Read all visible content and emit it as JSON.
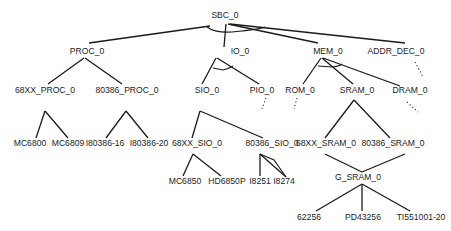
{
  "diagram": {
    "type": "and-or-tree",
    "root": "SBC_0",
    "nodes": [
      {
        "id": "SBC_0",
        "label": "SBC_0",
        "x": 225,
        "y": 18
      },
      {
        "id": "PROC_0",
        "label": "PROC_0",
        "x": 87,
        "y": 54
      },
      {
        "id": "IO_0",
        "label": "IO_0",
        "x": 240,
        "y": 54
      },
      {
        "id": "MEM_0",
        "label": "MEM_0",
        "x": 328,
        "y": 54
      },
      {
        "id": "ADDR_DEC_0",
        "label": "ADDR_DEC_0",
        "x": 396,
        "y": 54
      },
      {
        "id": "68XX_PROC_0",
        "label": "68XX_PROC_0",
        "x": 45,
        "y": 93
      },
      {
        "id": "80386_PROC_0",
        "label": "80386_PROC_0",
        "x": 127,
        "y": 93
      },
      {
        "id": "SIO_0",
        "label": "SIO_0",
        "x": 207,
        "y": 93
      },
      {
        "id": "PIO_0",
        "label": "PIO_0",
        "x": 262,
        "y": 93
      },
      {
        "id": "ROM_0",
        "label": "ROM_0",
        "x": 300,
        "y": 93
      },
      {
        "id": "SRAM_0",
        "label": "SRAM_0",
        "x": 357,
        "y": 93
      },
      {
        "id": "DRAM_0",
        "label": "DRAM_0",
        "x": 410,
        "y": 93
      },
      {
        "id": "MC6800",
        "label": "MC6800",
        "x": 30,
        "y": 146
      },
      {
        "id": "MC6809",
        "label": "MC6809",
        "x": 68,
        "y": 146
      },
      {
        "id": "I80386-16",
        "label": "I80386-16",
        "x": 105,
        "y": 146
      },
      {
        "id": "I80386-20",
        "label": "I80386-20",
        "x": 149,
        "y": 146
      },
      {
        "id": "68XX_SIO_0",
        "label": "68XX_SIO_0",
        "x": 197,
        "y": 146
      },
      {
        "id": "80386_SIO_0",
        "label": "80386_SIO_0",
        "x": 272,
        "y": 146
      },
      {
        "id": "68XX_SRAM_0",
        "label": "68XX_SRAM_0",
        "x": 326,
        "y": 146
      },
      {
        "id": "80386_SRAM_0",
        "label": "80386_SRAM_0",
        "x": 393,
        "y": 146
      },
      {
        "id": "MC6850",
        "label": "MC6850",
        "x": 185,
        "y": 184
      },
      {
        "id": "HD6850P",
        "label": "HD6850P",
        "x": 227,
        "y": 184
      },
      {
        "id": "I8251",
        "label": "I8251",
        "x": 260,
        "y": 184
      },
      {
        "id": "I8274",
        "label": "I8274",
        "x": 284,
        "y": 184
      },
      {
        "id": "G_SRAM_0",
        "label": "G_SRAM_0",
        "x": 358,
        "y": 180
      },
      {
        "id": "62256",
        "label": "62256",
        "x": 309,
        "y": 220
      },
      {
        "id": "PD43256",
        "label": "PD43256",
        "x": 363,
        "y": 220
      },
      {
        "id": "TI551001-20",
        "label": "TI551001-20",
        "x": 421,
        "y": 220
      }
    ],
    "edges": [
      {
        "from": "SBC_0",
        "to": "PROC_0",
        "style": "solid",
        "x1": 210,
        "y1": 26,
        "x2": 89,
        "y2": 43
      },
      {
        "from": "SBC_0",
        "to": "IO_0",
        "style": "solid",
        "x1": 226,
        "y1": 24,
        "x2": 224,
        "y2": 47
      },
      {
        "from": "SBC_0",
        "to": "MEM_0",
        "style": "solid",
        "x1": 228,
        "y1": 24,
        "x2": 318,
        "y2": 43
      },
      {
        "from": "SBC_0",
        "to": "ADDR_DEC_0",
        "style": "solid",
        "x1": 230,
        "y1": 24,
        "x2": 405,
        "y2": 43
      },
      {
        "from": "PROC_0",
        "to": "68XX_PROC_0",
        "style": "solid",
        "x1": 84,
        "y1": 58,
        "x2": 48,
        "y2": 84
      },
      {
        "from": "PROC_0",
        "to": "80386_PROC_0",
        "style": "solid",
        "x1": 85,
        "y1": 58,
        "x2": 122,
        "y2": 84
      },
      {
        "from": "IO_0",
        "to": "SIO_0",
        "style": "solid",
        "x1": 216,
        "y1": 58,
        "x2": 202,
        "y2": 84
      },
      {
        "from": "IO_0",
        "to": "PIO_0",
        "style": "solid",
        "x1": 217,
        "y1": 58,
        "x2": 259,
        "y2": 84
      },
      {
        "from": "MEM_0",
        "to": "ROM_0",
        "style": "solid",
        "x1": 321,
        "y1": 58,
        "x2": 303,
        "y2": 84
      },
      {
        "from": "MEM_0",
        "to": "SRAM_0",
        "style": "solid",
        "x1": 322,
        "y1": 58,
        "x2": 353,
        "y2": 84
      },
      {
        "from": "MEM_0",
        "to": "DRAM_0",
        "style": "solid",
        "x1": 323,
        "y1": 58,
        "x2": 400,
        "y2": 86
      },
      {
        "from": "68XX_PROC_0",
        "to": "MC6800",
        "style": "solid",
        "x1": 45,
        "y1": 111,
        "x2": 36,
        "y2": 138
      },
      {
        "from": "68XX_PROC_0",
        "to": "MC6809",
        "style": "solid",
        "x1": 45,
        "y1": 111,
        "x2": 68,
        "y2": 138
      },
      {
        "from": "80386_PROC_0",
        "to": "I80386-16",
        "style": "solid",
        "x1": 126,
        "y1": 111,
        "x2": 106,
        "y2": 138
      },
      {
        "from": "80386_PROC_0",
        "to": "I80386-20",
        "style": "solid",
        "x1": 126,
        "y1": 111,
        "x2": 148,
        "y2": 138
      },
      {
        "from": "SIO_0",
        "to": "68XX_SIO_0",
        "style": "solid",
        "x1": 200,
        "y1": 111,
        "x2": 192,
        "y2": 138
      },
      {
        "from": "SIO_0",
        "to": "80386_SIO_0",
        "style": "solid",
        "x1": 200,
        "y1": 111,
        "x2": 263,
        "y2": 138
      },
      {
        "from": "SRAM_0",
        "to": "68XX_SRAM_0",
        "style": "solid",
        "x1": 354,
        "y1": 100,
        "x2": 325,
        "y2": 138
      },
      {
        "from": "SRAM_0",
        "to": "80386_SRAM_0",
        "style": "solid",
        "x1": 354,
        "y1": 100,
        "x2": 390,
        "y2": 138
      },
      {
        "from": "68XX_SIO_0",
        "to": "MC6850",
        "style": "solid",
        "x1": 193,
        "y1": 154,
        "x2": 183,
        "y2": 176
      },
      {
        "from": "68XX_SIO_0",
        "to": "HD6850P",
        "style": "solid",
        "x1": 193,
        "y1": 154,
        "x2": 221,
        "y2": 176
      },
      {
        "from": "80386_SIO_0",
        "to": "I8251",
        "style": "solid",
        "x1": 260,
        "y1": 154,
        "x2": 260,
        "y2": 176
      },
      {
        "from": "80386_SIO_0",
        "to": "I8274",
        "style": "solid",
        "x1": 260,
        "y1": 154,
        "x2": 286,
        "y2": 177
      },
      {
        "from": "68XX_SRAM_0",
        "to": "G_SRAM_0",
        "style": "solid",
        "x1": 325,
        "y1": 154,
        "x2": 362,
        "y2": 172
      },
      {
        "from": "80386_SRAM_0",
        "to": "G_SRAM_0",
        "style": "solid",
        "x1": 405,
        "y1": 154,
        "x2": 362,
        "y2": 172
      },
      {
        "from": "G_SRAM_0",
        "to": "62256",
        "style": "solid",
        "x1": 362,
        "y1": 184,
        "x2": 316,
        "y2": 211
      },
      {
        "from": "G_SRAM_0",
        "to": "PD43256",
        "style": "solid",
        "x1": 362,
        "y1": 184,
        "x2": 362,
        "y2": 211
      },
      {
        "from": "G_SRAM_0",
        "to": "TI551001-20",
        "style": "solid",
        "x1": 362,
        "y1": 184,
        "x2": 410,
        "y2": 211
      },
      {
        "from": "ADDR_DEC_0",
        "to": "...",
        "style": "dotted",
        "x1": 415,
        "y1": 62,
        "x2": 423,
        "y2": 77
      },
      {
        "from": "PIO_0",
        "to": "...",
        "style": "dotted",
        "x1": 266,
        "y1": 98,
        "x2": 262,
        "y2": 109
      },
      {
        "from": "ROM_0",
        "to": "...",
        "style": "dotted",
        "x1": 297,
        "y1": 98,
        "x2": 294,
        "y2": 109
      },
      {
        "from": "DRAM_0",
        "to": "...",
        "style": "dotted",
        "x1": 407,
        "y1": 102,
        "x2": 418,
        "y2": 112
      }
    ],
    "arcs": [
      {
        "node": "SBC_0",
        "path": "M 207 27 Q 215 33 232 32 Q 262 29 265 27"
      },
      {
        "node": "IO_0",
        "path": "M 213 68 L 223 70 Q 228 69 233 66"
      },
      {
        "node": "MEM_0",
        "path": "M 318 66 L 333 67 Q 340 66 342 64"
      },
      {
        "node": "80386_SIO_0",
        "path": "M 260 154 L 274 160 L 286 177"
      }
    ]
  }
}
